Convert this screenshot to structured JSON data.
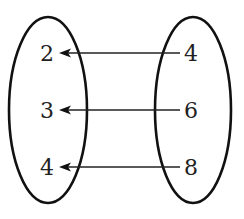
{
  "diagram": {
    "type": "mapping-diagram",
    "direction": "right-to-left",
    "colors": {
      "stroke": "#111111",
      "text": "#222222",
      "background": "#ffffff"
    },
    "left_set": {
      "elements": [
        "2",
        "3",
        "4"
      ]
    },
    "right_set": {
      "elements": [
        "4",
        "6",
        "8"
      ]
    },
    "mappings": [
      {
        "from": "4",
        "to": "2"
      },
      {
        "from": "6",
        "to": "3"
      },
      {
        "from": "8",
        "to": "4"
      }
    ]
  }
}
